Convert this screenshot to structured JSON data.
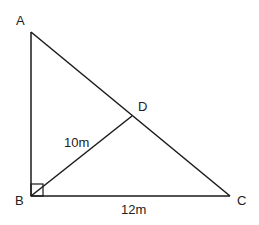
{
  "diagram": {
    "type": "right-triangle",
    "points": {
      "A": {
        "label": "A",
        "x": 31,
        "y": 32
      },
      "B": {
        "label": "B",
        "x": 31,
        "y": 196
      },
      "C": {
        "label": "C",
        "x": 230,
        "y": 196
      },
      "D": {
        "label": "D",
        "x": 132,
        "y": 116
      }
    },
    "segments": [
      {
        "from": "A",
        "to": "B"
      },
      {
        "from": "B",
        "to": "C"
      },
      {
        "from": "A",
        "to": "C"
      },
      {
        "from": "B",
        "to": "D"
      }
    ],
    "right_angle_at": "B",
    "measurements": {
      "BD": "10m",
      "BC": "12m"
    },
    "stroke_color": "#1a1a1a"
  }
}
